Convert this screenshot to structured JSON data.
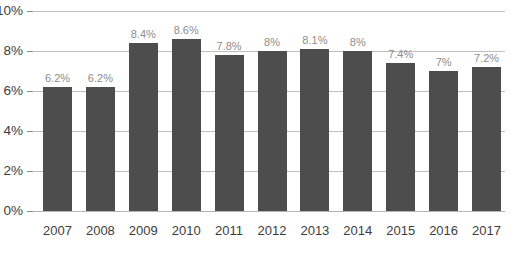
{
  "chart_data": {
    "type": "bar",
    "title": "",
    "subtitle": "",
    "xlabel": "",
    "ylabel": "",
    "categories": [
      "2007",
      "2008",
      "2009",
      "2010",
      "2011",
      "2012",
      "2013",
      "2014",
      "2015",
      "2016",
      "2017"
    ],
    "values": [
      6.2,
      6.2,
      8.4,
      8.6,
      7.8,
      8.0,
      8.1,
      8.0,
      7.4,
      7.0,
      7.2
    ],
    "data_labels": [
      "6.2%",
      "6.2%",
      "8.4%",
      "8.6%",
      "7.8%",
      "8%",
      "8.1%",
      "8%",
      "7.4%",
      "7%",
      "7.2%"
    ],
    "ylim": [
      0,
      10
    ],
    "y_ticks": [
      0,
      2,
      4,
      6,
      8,
      10
    ],
    "y_tick_labels": [
      "0%",
      "2%",
      "4%",
      "6%",
      "8%",
      "10%"
    ],
    "grid": true,
    "grid_axis": "y",
    "legend": false,
    "legend_position": "none",
    "series": [
      {
        "name": "",
        "values": [
          6.2,
          6.2,
          8.4,
          8.6,
          7.8,
          8.0,
          8.1,
          8.0,
          7.4,
          7.0,
          7.2
        ]
      }
    ],
    "colors": {
      "bar": "#4d4d4d",
      "gridline": "#bfbfbf",
      "axis_label": "#3d3d3d",
      "data_label": "#8c8c8c",
      "background": "#ffffff"
    }
  }
}
